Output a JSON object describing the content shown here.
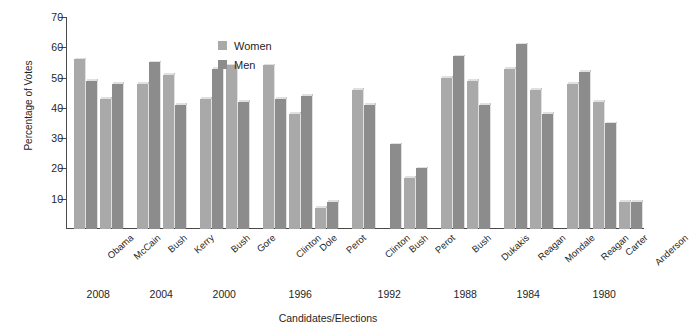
{
  "chart_data": {
    "type": "bar",
    "title": "",
    "xlabel": "Candidates/Elections",
    "ylabel": "Percentage of Votes",
    "ylim": [
      0,
      70
    ],
    "yticks": [
      10,
      20,
      30,
      40,
      50,
      60,
      70
    ],
    "grid": false,
    "legend_position": "top-left-inside",
    "categories": [
      "Obama",
      "McCain",
      "Bush",
      "Kerry",
      "Bush",
      "Gore",
      "Clinton",
      "Dole",
      "Perot",
      "Clinton",
      "Bush",
      "Perot",
      "Bush",
      "Dukakis",
      "Reagan",
      "Mondale",
      "Reagan",
      "Carter",
      "Anderson"
    ],
    "groups": [
      {
        "year": "2008",
        "candidates": [
          "Obama",
          "McCain"
        ]
      },
      {
        "year": "2004",
        "candidates": [
          "Bush",
          "Kerry"
        ]
      },
      {
        "year": "2000",
        "candidates": [
          "Bush",
          "Gore"
        ]
      },
      {
        "year": "1996",
        "candidates": [
          "Clinton",
          "Dole",
          "Perot"
        ]
      },
      {
        "year": "1992",
        "candidates": [
          "Clinton",
          "Bush",
          "Perot"
        ]
      },
      {
        "year": "1988",
        "candidates": [
          "Bush",
          "Dukakis"
        ]
      },
      {
        "year": "1984",
        "candidates": [
          "Reagan",
          "Mondale"
        ]
      },
      {
        "year": "1980",
        "candidates": [
          "Reagan",
          "Carter",
          "Anderson"
        ]
      }
    ],
    "series": [
      {
        "name": "Women",
        "color": "#a9a9a9",
        "values": [
          56,
          43,
          48,
          51,
          43,
          54,
          54,
          38,
          7,
          46,
          0,
          17,
          50,
          49,
          53,
          46,
          48,
          42,
          9
        ]
      },
      {
        "name": "Men",
        "color": "#8c8c8c",
        "values": [
          49,
          48,
          55,
          41,
          53,
          42,
          43,
          44,
          9,
          41,
          28,
          20,
          57,
          41,
          61,
          38,
          52,
          35,
          9
        ]
      }
    ]
  },
  "legend": {
    "items": [
      {
        "label": "Women",
        "swatch": "women"
      },
      {
        "label": "Men",
        "swatch": "men"
      }
    ]
  },
  "axes": {
    "y_title": "Percentage of Votes",
    "x_title": "Candidates/Elections"
  }
}
